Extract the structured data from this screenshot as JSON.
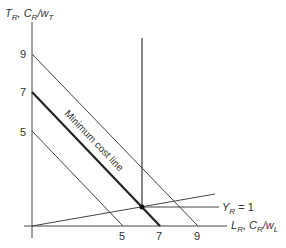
{
  "diagram": {
    "y_axis_label": {
      "main": "T",
      "sub": "R",
      "sep": ", ",
      "main2": "C",
      "sub2": "R",
      "slash": "/w",
      "sub3": "T"
    },
    "x_axis_label": {
      "main": "L",
      "sub": "R",
      "sep": ", ",
      "main2": "C",
      "sub2": "R",
      "slash": "/w",
      "sub3": "L"
    },
    "y_ticks": [
      "9",
      "7",
      "5"
    ],
    "x_ticks": [
      "5",
      "7",
      "9"
    ],
    "isoquant_label": {
      "main": "Y",
      "sub": "R",
      "rest": " = 1"
    },
    "min_cost_label": "Minimum cost line",
    "line_color": "#333333"
  }
}
